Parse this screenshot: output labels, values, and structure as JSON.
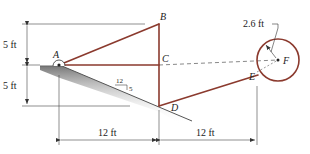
{
  "diagram": {
    "points": {
      "A": {
        "label": "A"
      },
      "B": {
        "label": "B"
      },
      "C": {
        "label": "C"
      },
      "D": {
        "label": "D"
      },
      "E": {
        "label": "E"
      },
      "F": {
        "label": "F"
      }
    },
    "dimensions": {
      "vertical_top": "5 ft",
      "vertical_bottom": "5 ft",
      "horizontal_left": "12 ft",
      "horizontal_right": "12 ft",
      "radius": "2.6 ft"
    },
    "slope": {
      "run": "12",
      "rise": "5"
    },
    "colors": {
      "member": "#8b3a2e",
      "dimension": "#333333",
      "ground": "#888888"
    }
  }
}
